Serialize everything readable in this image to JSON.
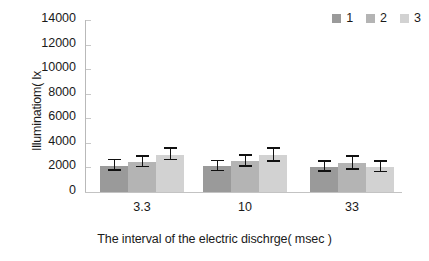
{
  "chart_data": {
    "type": "bar",
    "title": "",
    "xlabel": "The interval of the electric dischrge( msec )",
    "ylabel": "Illuminatiom( lx",
    "categories": [
      "3.3",
      "10",
      "33"
    ],
    "ylim": [
      0,
      14000
    ],
    "ytick_labels": [
      "14000",
      "12000",
      "10000",
      "8000",
      "6000",
      "4000",
      "2000",
      "0"
    ],
    "ytick_values": [
      14000,
      12000,
      10000,
      8000,
      6000,
      4000,
      2000,
      0
    ],
    "ytick_step": 2000,
    "grid": false,
    "legend_position": "top-right",
    "series": [
      {
        "name": "1",
        "color": "#9a9a9a",
        "values": [
          2150,
          2100,
          2050
        ],
        "errors": [
          420,
          400,
          390
        ]
      },
      {
        "name": "2",
        "color": "#b4b4b4",
        "values": [
          2450,
          2500,
          2350
        ],
        "errors": [
          430,
          450,
          520
        ]
      },
      {
        "name": "3",
        "color": "#d2d2d2",
        "values": [
          3050,
          3000,
          2050
        ],
        "errors": [
          480,
          520,
          430
        ]
      }
    ]
  },
  "legend": {
    "items": [
      {
        "label": "1",
        "color": "#9a9a9a"
      },
      {
        "label": "2",
        "color": "#b4b4b4"
      },
      {
        "label": "3",
        "color": "#d2d2d2"
      }
    ]
  }
}
